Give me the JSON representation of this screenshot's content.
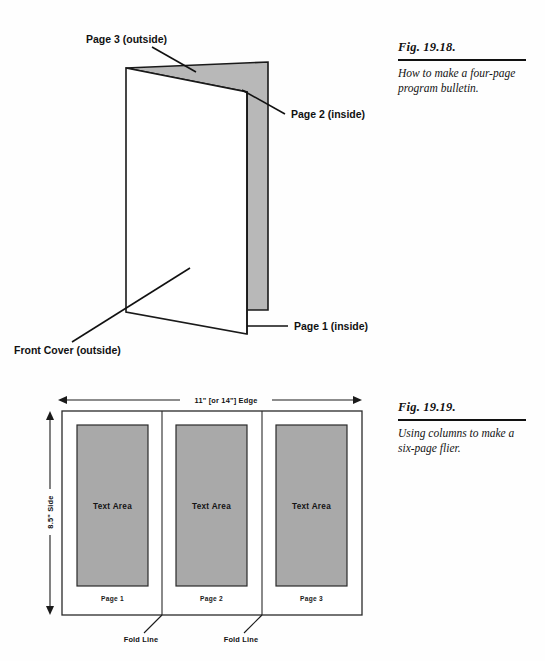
{
  "figures": [
    {
      "id": "fig-19-18",
      "number": "Fig. 19.18.",
      "description": "How to make a four-page program bulletin.",
      "labels": {
        "page3": "Page 3 (outside)",
        "page2": "Page 2 (inside)",
        "page1": "Page 1 (inside)",
        "front_cover": "Front Cover (outside)"
      },
      "colors": {
        "panel_fill": "#b8b8b8",
        "outline": "#1a1a1a",
        "front_fill": "#ffffff"
      }
    },
    {
      "id": "fig-19-19",
      "number": "Fig. 19.19.",
      "description": "Using columns to make a six-page flier.",
      "dimensions": {
        "horizontal": "11\" [or 14\"] Edge",
        "vertical": "8.5\" Side"
      },
      "columns": [
        {
          "text_area_label": "Text Area",
          "page_label": "Page 1"
        },
        {
          "text_area_label": "Text Area",
          "page_label": "Page 2"
        },
        {
          "text_area_label": "Text Area",
          "page_label": "Page 3"
        }
      ],
      "fold_lines": [
        {
          "label": "Fold Line"
        },
        {
          "label": "Fold Line"
        }
      ],
      "colors": {
        "text_area_fill": "#a9a9a9",
        "sheet_fill": "#ffffff",
        "outline": "#2a2a2a"
      }
    }
  ]
}
